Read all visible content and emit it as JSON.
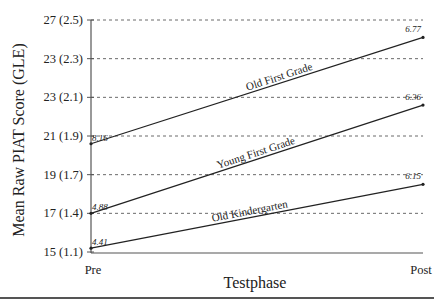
{
  "chart_data": {
    "type": "line",
    "title": "",
    "xlabel": "Testphase",
    "ylabel": "Mean Raw PIAT Score (GLE)",
    "categories": [
      "Pre",
      "Post"
    ],
    "y_tick_labels": [
      "27 (2.5)",
      "23 (2.3)",
      "23 (2.1)",
      "21 (1.9)",
      "19 (1.7)",
      "17 (1.4)",
      "15 (1.1)"
    ],
    "y_tick_values": [
      27,
      25,
      23,
      21,
      19,
      17,
      15
    ],
    "ylim": [
      15,
      27
    ],
    "grid": "horizontal dashed",
    "legend": "inline labels on lines",
    "series": [
      {
        "name": "Old First Grade",
        "values": [
          20.6,
          26.1
        ],
        "annotations": [
          "8.16",
          "6.77"
        ]
      },
      {
        "name": "Young First Grade",
        "values": [
          17.0,
          22.6
        ],
        "annotations": [
          "4.88",
          "6.36"
        ]
      },
      {
        "name": "Old Kindergarten",
        "values": [
          15.2,
          18.5
        ],
        "annotations": [
          "4.41",
          "6.15"
        ]
      }
    ],
    "colors": {
      "line": "#222222",
      "grid": "#444444",
      "axis": "#555555"
    }
  }
}
